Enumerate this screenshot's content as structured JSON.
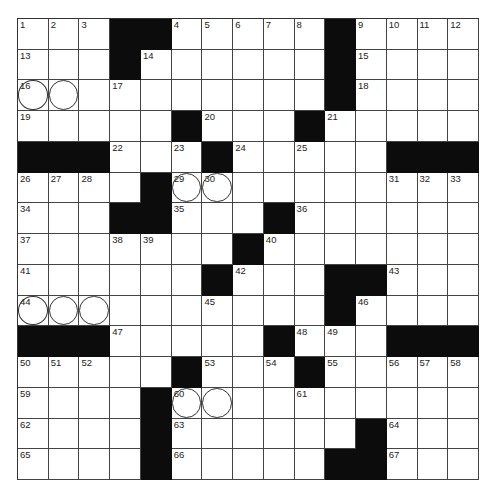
{
  "puzzle": {
    "size": 15,
    "rows": [
      "...##.....#....",
      "...#......#....",
      "..........#....",
      ".....#...#.....",
      "###...#.....###",
      "....#..........",
      "...##...#......",
      ".......#.......",
      "......#...##...",
      "..........#....",
      "###.....#...###",
      ".....#...#.....",
      "....#..........",
      "....#......#...",
      "....#.....##..."
    ],
    "numbers": [
      {
        "r": 0,
        "c": 0,
        "n": "1"
      },
      {
        "r": 0,
        "c": 1,
        "n": "2"
      },
      {
        "r": 0,
        "c": 2,
        "n": "3"
      },
      {
        "r": 0,
        "c": 5,
        "n": "4"
      },
      {
        "r": 0,
        "c": 6,
        "n": "5"
      },
      {
        "r": 0,
        "c": 7,
        "n": "6"
      },
      {
        "r": 0,
        "c": 8,
        "n": "7"
      },
      {
        "r": 0,
        "c": 9,
        "n": "8"
      },
      {
        "r": 0,
        "c": 11,
        "n": "9"
      },
      {
        "r": 0,
        "c": 12,
        "n": "10"
      },
      {
        "r": 0,
        "c": 13,
        "n": "11"
      },
      {
        "r": 0,
        "c": 14,
        "n": "12"
      },
      {
        "r": 1,
        "c": 0,
        "n": "13"
      },
      {
        "r": 1,
        "c": 4,
        "n": "14"
      },
      {
        "r": 1,
        "c": 11,
        "n": "15"
      },
      {
        "r": 2,
        "c": 0,
        "n": "16"
      },
      {
        "r": 2,
        "c": 3,
        "n": "17"
      },
      {
        "r": 2,
        "c": 11,
        "n": "18"
      },
      {
        "r": 3,
        "c": 0,
        "n": "19"
      },
      {
        "r": 3,
        "c": 6,
        "n": "20"
      },
      {
        "r": 3,
        "c": 10,
        "n": "21"
      },
      {
        "r": 4,
        "c": 3,
        "n": "22"
      },
      {
        "r": 4,
        "c": 5,
        "n": "23"
      },
      {
        "r": 4,
        "c": 7,
        "n": "24"
      },
      {
        "r": 4,
        "c": 9,
        "n": "25"
      },
      {
        "r": 5,
        "c": 0,
        "n": "26"
      },
      {
        "r": 5,
        "c": 1,
        "n": "27"
      },
      {
        "r": 5,
        "c": 2,
        "n": "28"
      },
      {
        "r": 5,
        "c": 5,
        "n": "29"
      },
      {
        "r": 5,
        "c": 6,
        "n": "30"
      },
      {
        "r": 5,
        "c": 12,
        "n": "31"
      },
      {
        "r": 5,
        "c": 13,
        "n": "32"
      },
      {
        "r": 5,
        "c": 14,
        "n": "33"
      },
      {
        "r": 6,
        "c": 0,
        "n": "34"
      },
      {
        "r": 6,
        "c": 5,
        "n": "35"
      },
      {
        "r": 6,
        "c": 9,
        "n": "36"
      },
      {
        "r": 7,
        "c": 0,
        "n": "37"
      },
      {
        "r": 7,
        "c": 3,
        "n": "38"
      },
      {
        "r": 7,
        "c": 4,
        "n": "39"
      },
      {
        "r": 7,
        "c": 8,
        "n": "40"
      },
      {
        "r": 8,
        "c": 0,
        "n": "41"
      },
      {
        "r": 8,
        "c": 7,
        "n": "42"
      },
      {
        "r": 8,
        "c": 12,
        "n": "43"
      },
      {
        "r": 9,
        "c": 0,
        "n": "44"
      },
      {
        "r": 9,
        "c": 6,
        "n": "45"
      },
      {
        "r": 9,
        "c": 11,
        "n": "46"
      },
      {
        "r": 10,
        "c": 3,
        "n": "47"
      },
      {
        "r": 10,
        "c": 9,
        "n": "48"
      },
      {
        "r": 10,
        "c": 10,
        "n": "49"
      },
      {
        "r": 11,
        "c": 0,
        "n": "50"
      },
      {
        "r": 11,
        "c": 1,
        "n": "51"
      },
      {
        "r": 11,
        "c": 2,
        "n": "52"
      },
      {
        "r": 11,
        "c": 6,
        "n": "53"
      },
      {
        "r": 11,
        "c": 8,
        "n": "54"
      },
      {
        "r": 11,
        "c": 10,
        "n": "55"
      },
      {
        "r": 11,
        "c": 12,
        "n": "56"
      },
      {
        "r": 11,
        "c": 13,
        "n": "57"
      },
      {
        "r": 11,
        "c": 14,
        "n": "58"
      },
      {
        "r": 12,
        "c": 0,
        "n": "59"
      },
      {
        "r": 12,
        "c": 5,
        "n": "60"
      },
      {
        "r": 12,
        "c": 9,
        "n": "61"
      },
      {
        "r": 13,
        "c": 0,
        "n": "62"
      },
      {
        "r": 13,
        "c": 5,
        "n": "63"
      },
      {
        "r": 13,
        "c": 12,
        "n": "64"
      },
      {
        "r": 14,
        "c": 0,
        "n": "65"
      },
      {
        "r": 14,
        "c": 5,
        "n": "66"
      },
      {
        "r": 14,
        "c": 12,
        "n": "67"
      }
    ],
    "circles": [
      {
        "r": 2,
        "c": 0
      },
      {
        "r": 2,
        "c": 1
      },
      {
        "r": 5,
        "c": 5
      },
      {
        "r": 5,
        "c": 6
      },
      {
        "r": 9,
        "c": 0
      },
      {
        "r": 9,
        "c": 1
      },
      {
        "r": 9,
        "c": 2
      },
      {
        "r": 12,
        "c": 5
      },
      {
        "r": 12,
        "c": 6
      }
    ],
    "colors": {
      "block": "#0c0c0c",
      "line": "#444444",
      "background": "#ffffff"
    }
  }
}
